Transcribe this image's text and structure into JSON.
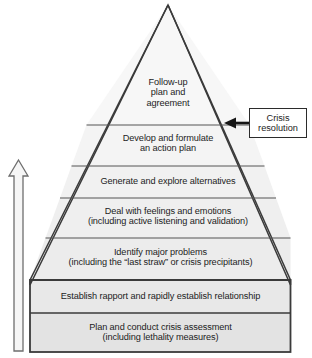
{
  "diagram": {
    "type": "pyramid",
    "tier_count": 7,
    "colors": {
      "outline": "#3a3a3a",
      "divider": "#555555",
      "tier_fill_light": "#f2f2f2",
      "tier_fill_mid": "#ededed",
      "tier_fill_dark": "#e4e4e4",
      "text": "#1c1c1c",
      "arrow_outline": "#666666",
      "arrow_fill": "#f5f5f5"
    },
    "tiers": [
      {
        "index": 1,
        "position": "top",
        "text": "Follow-up\nplan and\nagreement",
        "font_size": "9.2px"
      },
      {
        "index": 2,
        "position": "second",
        "text": "Develop and formulate\nan action plan",
        "font_size": "9.2px"
      },
      {
        "index": 3,
        "position": "third",
        "text": "Generate and explore alternatives",
        "font_size": "9.2px"
      },
      {
        "index": 4,
        "position": "fourth",
        "text": "Deal with feelings and emotions\n(including active listening and validation)",
        "font_size": "9.2px"
      },
      {
        "index": 5,
        "position": "fifth",
        "text": "Identify major problems\n(including the “last straw” or crisis precipitants)",
        "font_size": "9.2px"
      },
      {
        "index": 6,
        "position": "sixth",
        "text": "Establish rapport and rapidly establish relationship",
        "font_size": "9.2px"
      },
      {
        "index": 7,
        "position": "base",
        "text": "Plan and conduct crisis assessment\n(including lethality measures)",
        "font_size": "9.2px"
      }
    ]
  },
  "callout": {
    "text": "Crisis\nresolution",
    "font_size": "9.2px",
    "arrow_direction": "left",
    "points_to_tier": 2
  },
  "progress_arrow": {
    "direction": "up",
    "style": "hollow-outline",
    "meaning": "sequence from base to apex"
  }
}
